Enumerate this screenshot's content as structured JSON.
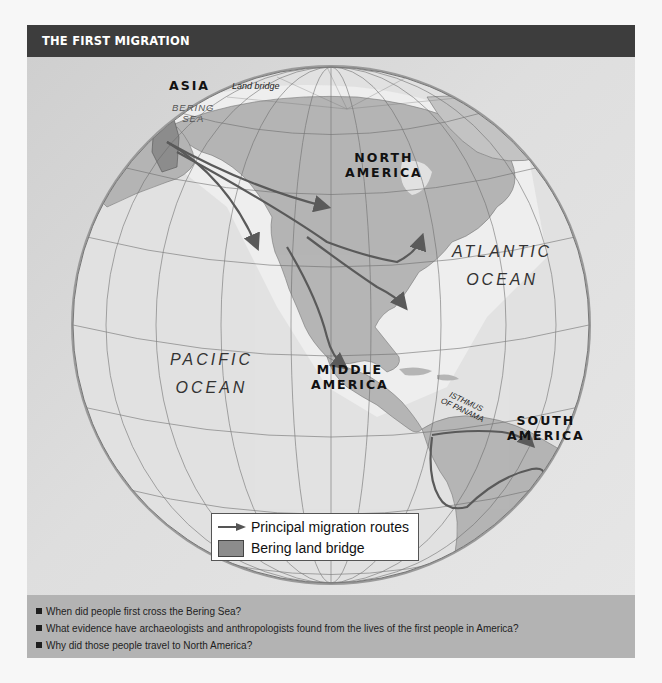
{
  "header": {
    "title": "THE FIRST MIGRATION"
  },
  "map": {
    "labels": {
      "asia": "ASIA",
      "land_bridge": "Land bridge",
      "bering_sea_line1": "BERING",
      "bering_sea_line2": "SEA",
      "north_america_line1": "NORTH",
      "north_america_line2": "AMERICA",
      "middle_america_line1": "MIDDLE",
      "middle_america_line2": "AMERICA",
      "south_america_line1": "SOUTH",
      "south_america_line2": "AMERICA",
      "atlantic_line1": "ATLANTIC",
      "atlantic_line2": "OCEAN",
      "pacific_line1": "PACIFIC",
      "pacific_line2": "OCEAN",
      "isthmus_line1": "ISTHMUS",
      "isthmus_line2": "OF PANAMA"
    },
    "colors": {
      "land": "#b5b5b5",
      "land_bridge": "#8c8c8c",
      "ocean": "#e2e2e2",
      "shallow": "#eeeeee",
      "route": "#5a5a5a",
      "grid": "#6a6a6a"
    },
    "legend": {
      "items": [
        {
          "symbol": "arrow-icon",
          "label": "Principal migration routes"
        },
        {
          "symbol": "land-bridge-swatch",
          "label": "Bering land bridge"
        }
      ]
    }
  },
  "questions": [
    "When did people first cross the Bering Sea?",
    "What evidence have archaeologists and anthropologists found from the lives of the first people in America?",
    "Why did those people travel to North America?"
  ]
}
